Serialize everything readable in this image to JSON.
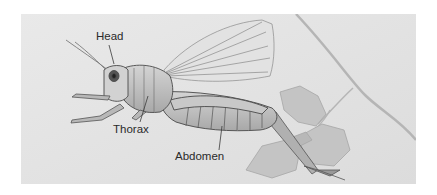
{
  "figure": {
    "labels": [
      {
        "id": "head",
        "text": "Head"
      },
      {
        "id": "thorax",
        "text": "Thorax"
      },
      {
        "id": "abdomen",
        "text": "Abdomen"
      }
    ]
  },
  "colors": {
    "background": "#e6e6e6",
    "label_text": "#2a2a2a",
    "leader_line": "#3a3a3a"
  }
}
